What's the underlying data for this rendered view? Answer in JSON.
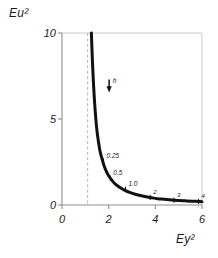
{
  "figure": {
    "background_color": "#ffffff",
    "curve_color": "#111111",
    "axis_color": "#8d8d8d",
    "frame_color": "#c9c9c9",
    "dashed_line_color": "#b4b4b4"
  },
  "chart_data": {
    "type": "line",
    "title": "",
    "subtitle": "",
    "xlabel": "Ey²",
    "ylabel": "Eu²",
    "xlim": [
      0,
      6
    ],
    "ylim": [
      0,
      10
    ],
    "xticks": [
      0,
      2,
      4,
      6
    ],
    "xtick_labels": [
      "0",
      "2",
      "4",
      "6"
    ],
    "yticks": [
      0,
      5,
      10
    ],
    "ytick_labels": [
      "0",
      "5",
      "10"
    ],
    "grid": false,
    "legend_position": "none",
    "series": [
      {
        "name": "specific energy curve",
        "style": "solid",
        "width_px": 3,
        "color": "#111111",
        "x": [
          1.26,
          1.28,
          1.3,
          1.33,
          1.36,
          1.4,
          1.45,
          1.5,
          1.56,
          1.62,
          1.7,
          1.8,
          1.9,
          2.0,
          2.15,
          2.3,
          2.5,
          2.7,
          2.9,
          3.1,
          3.35,
          3.6,
          3.85,
          4.1,
          4.4,
          4.7,
          5.0,
          5.3,
          5.6,
          5.9,
          6.0
        ],
        "y": [
          10.0,
          9.2,
          8.5,
          7.6,
          6.8,
          5.9,
          5.0,
          4.3,
          3.7,
          3.2,
          2.75,
          2.3,
          1.95,
          1.7,
          1.42,
          1.2,
          1.0,
          0.85,
          0.73,
          0.64,
          0.55,
          0.48,
          0.42,
          0.37,
          0.33,
          0.29,
          0.26,
          0.24,
          0.22,
          0.2,
          0.19
        ]
      }
    ],
    "asymptote": {
      "type": "vertical-dashed",
      "x": 1.1,
      "label": "",
      "color": "#b4b4b4"
    },
    "point_labels": [
      {
        "label": "0.25",
        "x": 1.78,
        "y": 2.55,
        "tick": true
      },
      {
        "label": "0.5",
        "x": 2.07,
        "y": 1.55,
        "tick": true
      },
      {
        "label": "1.0",
        "x": 2.72,
        "y": 0.92,
        "tick": true
      },
      {
        "label": "2",
        "x": 3.78,
        "y": 0.44,
        "tick": true
      },
      {
        "label": "3",
        "x": 4.8,
        "y": 0.28,
        "tick": true
      },
      {
        "label": "4",
        "x": 5.85,
        "y": 0.21,
        "tick": true
      }
    ],
    "annotations": [
      {
        "label": "h",
        "x": 2.02,
        "y": 7.0,
        "arrow": "down"
      }
    ]
  }
}
